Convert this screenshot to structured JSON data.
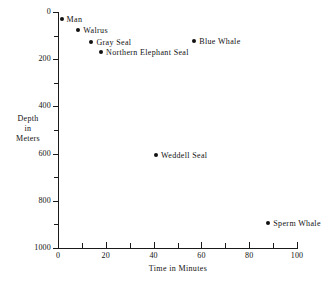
{
  "chart_data": {
    "type": "scatter",
    "title": "",
    "xlabel": "Time in Minutes",
    "ylabel_lines": [
      "Depth",
      "in",
      "Meters"
    ],
    "ylabel": "Depth in Meters",
    "xlim": [
      0,
      100
    ],
    "ylim": [
      0,
      1000
    ],
    "y_axis_inverted": true,
    "grid": false,
    "legend": "none",
    "x_ticks_major": [
      0,
      20,
      40,
      60,
      80,
      100
    ],
    "x_ticks_minor": [
      10,
      30,
      50,
      70,
      90
    ],
    "x_tick_labels": [
      "0",
      "20",
      "40",
      "60",
      "80",
      "100"
    ],
    "y_ticks_major": [
      0,
      200,
      400,
      600,
      800,
      1000
    ],
    "y_ticks_minor": [
      100,
      300,
      500,
      700,
      900
    ],
    "y_tick_labels": [
      "0",
      "200",
      "400",
      "600",
      "800",
      "1000"
    ],
    "points": [
      {
        "label": "Man",
        "x": 1.5,
        "y": 30
      },
      {
        "label": "Walrus",
        "x": 8.5,
        "y": 75
      },
      {
        "label": "Gray Seal",
        "x": 14.0,
        "y": 127
      },
      {
        "label": "Blue Whale",
        "x": 57.0,
        "y": 123
      },
      {
        "label": "Northern Elephant Seal",
        "x": 18.0,
        "y": 170
      },
      {
        "label": "Weddell Seal",
        "x": 41.0,
        "y": 605
      },
      {
        "label": "Sperm Whale",
        "x": 88.0,
        "y": 895
      }
    ],
    "marker_color": "#111111",
    "axis_color": "#1a1a1a"
  }
}
